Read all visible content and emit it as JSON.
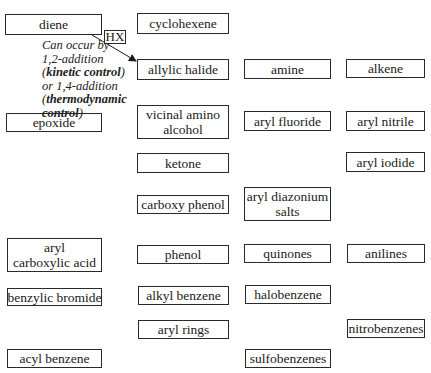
{
  "diagram": {
    "reagent_label": "HX",
    "annotation": {
      "lines": [
        {
          "parts": [
            {
              "text": "Can occur by",
              "bold": false
            }
          ]
        },
        {
          "parts": [
            {
              "text": "1,2-addition",
              "bold": false
            }
          ]
        },
        {
          "parts": [
            {
              "text": "(",
              "bold": false
            },
            {
              "text": "kinetic control",
              "bold": true
            },
            {
              "text": ")",
              "bold": false
            }
          ]
        },
        {
          "parts": [
            {
              "text": "or 1,4-addition",
              "bold": false
            }
          ]
        },
        {
          "parts": [
            {
              "text": "(",
              "bold": false
            },
            {
              "text": "thermodynamic",
              "bold": true
            }
          ]
        },
        {
          "parts": [
            {
              "text": "control",
              "bold": true
            },
            {
              "text": ")",
              "bold": false
            }
          ]
        }
      ]
    },
    "arrow": {
      "from": "diene",
      "to": "allylic halide",
      "label": "HX"
    },
    "nodes": [
      {
        "id": "diene",
        "lines": [
          "diene"
        ],
        "x": 5,
        "y": 14,
        "w": 97,
        "h": 21
      },
      {
        "id": "cyclohexene",
        "lines": [
          "cyclohexene"
        ],
        "x": 137,
        "y": 13,
        "w": 92,
        "h": 21
      },
      {
        "id": "allylic-halide",
        "lines": [
          "allylic halide"
        ],
        "x": 137,
        "y": 59,
        "w": 92,
        "h": 21
      },
      {
        "id": "amine",
        "lines": [
          "amine"
        ],
        "x": 244,
        "y": 59,
        "w": 87,
        "h": 20
      },
      {
        "id": "alkene",
        "lines": [
          "alkene"
        ],
        "x": 346,
        "y": 59,
        "w": 79,
        "h": 19
      },
      {
        "id": "epoxide",
        "lines": [
          "epoxide"
        ],
        "x": 6,
        "y": 113,
        "w": 96,
        "h": 19
      },
      {
        "id": "vicinal-amino-alcohol",
        "lines": [
          "vicinal amino",
          "alcohol"
        ],
        "x": 137,
        "y": 105,
        "w": 92,
        "h": 34
      },
      {
        "id": "aryl-fluoride",
        "lines": [
          "aryl fluoride"
        ],
        "x": 244,
        "y": 111,
        "w": 87,
        "h": 20
      },
      {
        "id": "aryl-nitrile",
        "lines": [
          "aryl nitrile"
        ],
        "x": 346,
        "y": 111,
        "w": 79,
        "h": 20
      },
      {
        "id": "ketone",
        "lines": [
          "ketone"
        ],
        "x": 137,
        "y": 153,
        "w": 92,
        "h": 20
      },
      {
        "id": "aryl-iodide",
        "lines": [
          "aryl iodide"
        ],
        "x": 346,
        "y": 152,
        "w": 79,
        "h": 20
      },
      {
        "id": "carboxy-phenol",
        "lines": [
          "carboxy phenol"
        ],
        "x": 137,
        "y": 195,
        "w": 92,
        "h": 19
      },
      {
        "id": "aryl-diazonium-salts",
        "lines": [
          "aryl diazonium",
          "salts"
        ],
        "x": 244,
        "y": 187,
        "w": 87,
        "h": 34
      },
      {
        "id": "aryl-carboxylic-acid",
        "lines": [
          "aryl",
          "carboxylic acid"
        ],
        "x": 7,
        "y": 238,
        "w": 95,
        "h": 34
      },
      {
        "id": "phenol",
        "lines": [
          "phenol"
        ],
        "x": 137,
        "y": 245,
        "w": 92,
        "h": 19
      },
      {
        "id": "quinones",
        "lines": [
          "quinones"
        ],
        "x": 244,
        "y": 244,
        "w": 87,
        "h": 19
      },
      {
        "id": "anilines",
        "lines": [
          "anilines"
        ],
        "x": 347,
        "y": 244,
        "w": 78,
        "h": 19
      },
      {
        "id": "benzylic-bromide",
        "lines": [
          "benzylic bromide"
        ],
        "x": 7,
        "y": 288,
        "w": 95,
        "h": 18
      },
      {
        "id": "alkyl-benzene",
        "lines": [
          "alkyl benzene"
        ],
        "x": 138,
        "y": 286,
        "w": 91,
        "h": 19
      },
      {
        "id": "halobenzene",
        "lines": [
          "halobenzene"
        ],
        "x": 245,
        "y": 285,
        "w": 86,
        "h": 19
      },
      {
        "id": "aryl-rings",
        "lines": [
          "aryl rings"
        ],
        "x": 138,
        "y": 320,
        "w": 91,
        "h": 19
      },
      {
        "id": "nitrobenzenes",
        "lines": [
          "nitrobenzenes"
        ],
        "x": 347,
        "y": 319,
        "w": 78,
        "h": 19
      },
      {
        "id": "acyl-benzene",
        "lines": [
          "acyl benzene"
        ],
        "x": 7,
        "y": 349,
        "w": 95,
        "h": 19
      },
      {
        "id": "sulfobenzenes",
        "lines": [
          "sulfobenzenes"
        ],
        "x": 245,
        "y": 349,
        "w": 86,
        "h": 19
      }
    ],
    "colors": {
      "border": "#2a2a2a",
      "text": "#1a1a1a",
      "background": "#ffffff"
    }
  }
}
